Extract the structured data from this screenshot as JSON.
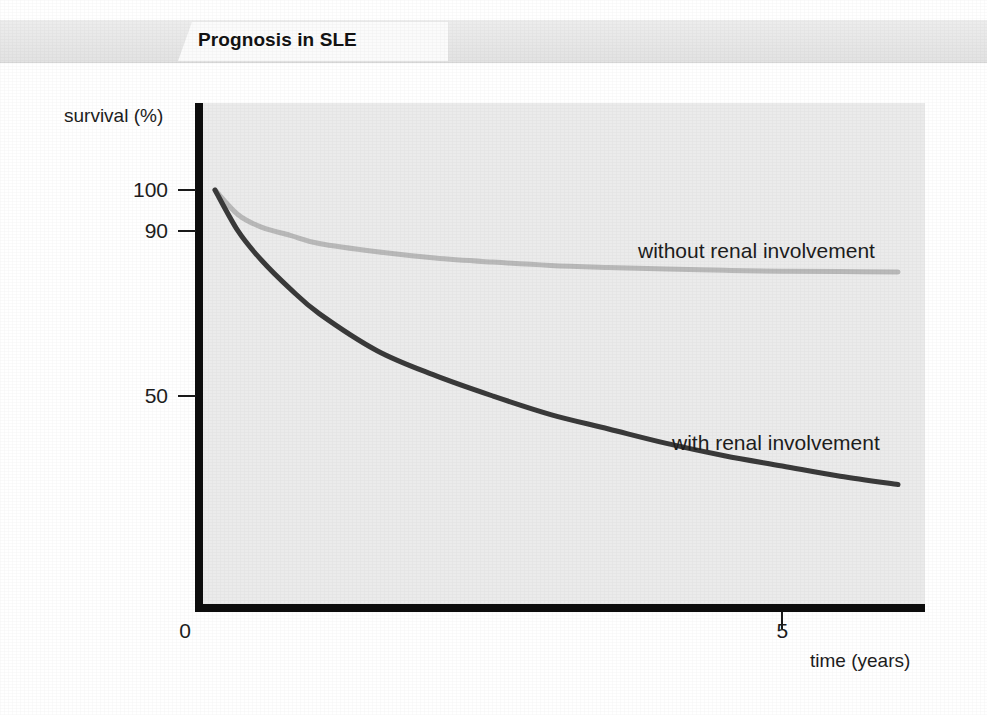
{
  "header": {
    "title": "Prognosis in SLE",
    "band_color": "#e9e9e9",
    "tab_color": "#fbfbfb"
  },
  "chart_data": {
    "type": "line",
    "title": "Prognosis in SLE",
    "xlabel": "time (years)",
    "ylabel": "survival (%)",
    "xlim": [
      0,
      6.2
    ],
    "ylim": [
      0,
      105
    ],
    "x_ticks": [
      {
        "label": "0",
        "value": 0
      },
      {
        "label": "5",
        "value": 5
      }
    ],
    "y_ticks": [
      {
        "label": "100",
        "value": 100
      },
      {
        "label": "90",
        "value": 90
      },
      {
        "label": "50",
        "value": 50
      }
    ],
    "grid": false,
    "legend": "inline-annotations",
    "x": [
      0.1,
      0.3,
      0.5,
      0.75,
      1.0,
      1.5,
      2.0,
      2.5,
      3.0,
      3.5,
      4.0,
      4.5,
      5.0,
      5.5,
      6.0
    ],
    "series": [
      {
        "name": "without renal involvement",
        "label": "without renal involvement",
        "color": "#b9b9b9",
        "values": [
          100,
          94,
          91,
          89,
          87,
          85,
          83.5,
          82.5,
          81.7,
          81.2,
          80.8,
          80.5,
          80.3,
          80.2,
          80.1
        ]
      },
      {
        "name": "with renal involvement",
        "label": "with renal involvement",
        "color": "#3a3a3a",
        "values": [
          100,
          90,
          83,
          76,
          70,
          61,
          55,
          50,
          45.5,
          42,
          38.5,
          35.5,
          33,
          30.5,
          28.5
        ]
      }
    ],
    "annotations": [
      {
        "text": "without renal involvement",
        "x_px": 638,
        "y_px": 240
      },
      {
        "text": "with renal involvement",
        "x_px": 672,
        "y_px": 432
      }
    ]
  }
}
